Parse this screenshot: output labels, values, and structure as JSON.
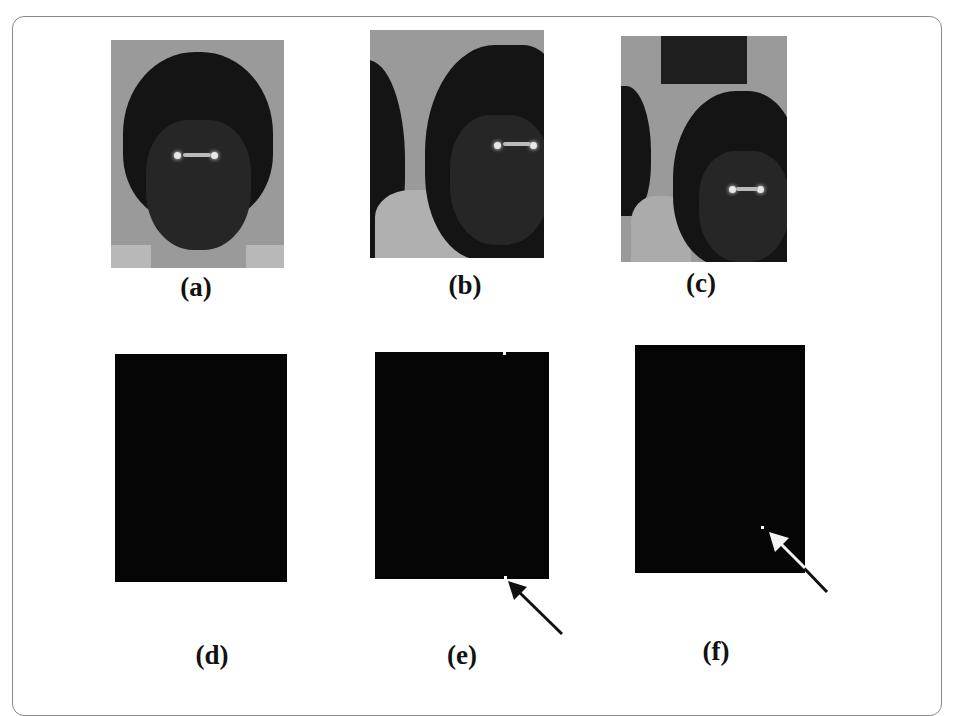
{
  "figure": {
    "panels": [
      {
        "id": "a",
        "label": "(a)",
        "content": "original-face-image"
      },
      {
        "id": "b",
        "label": "(b)",
        "content": "shifted-face-image"
      },
      {
        "id": "c",
        "label": "(c)",
        "content": "shifted-face-image-with-block"
      },
      {
        "id": "d",
        "label": "(d)",
        "content": "black-difference-image"
      },
      {
        "id": "e",
        "label": "(e)",
        "content": "black-difference-image-with-marker"
      },
      {
        "id": "f",
        "label": "(f)",
        "content": "black-difference-image-with-marker"
      }
    ],
    "annotations": [
      {
        "panel": "e",
        "type": "arrow",
        "color": "#111111",
        "points_to": "white dot at bottom edge"
      },
      {
        "panel": "f",
        "type": "arrow",
        "color": "#f2f2f2",
        "points_to": "white dot near lower right"
      }
    ],
    "colors": {
      "frame_border": "#8a8a8a",
      "photo_background": "#9a9a9a",
      "dark_panel": "#050505",
      "label_text": "#111111"
    }
  }
}
